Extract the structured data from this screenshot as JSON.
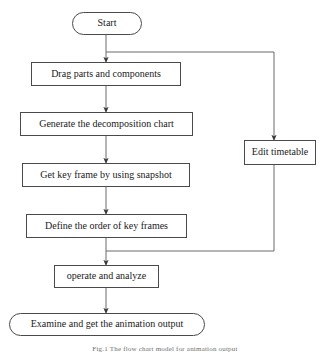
{
  "diagram": {
    "type": "flowchart",
    "orientation": "top-to-bottom",
    "stroke_color": "#4a4a4a",
    "text_color": "#1a1a1a",
    "background_color": "#ffffff",
    "nodes": [
      {
        "id": "start",
        "label": "Start",
        "shape": "terminal",
        "x": 72,
        "y": 12,
        "w": 70,
        "h": 23,
        "font_size": 10
      },
      {
        "id": "drag",
        "label": "Drag parts and components",
        "shape": "process",
        "x": 31,
        "y": 62,
        "w": 150,
        "h": 24,
        "font_size": 10
      },
      {
        "id": "generate",
        "label": "Generate the decomposition chart",
        "shape": "process",
        "x": 20,
        "y": 112,
        "w": 173,
        "h": 24,
        "font_size": 10
      },
      {
        "id": "keyframe",
        "label": "Get key frame by using snapshot",
        "shape": "process",
        "x": 22,
        "y": 163,
        "w": 168,
        "h": 24,
        "font_size": 10
      },
      {
        "id": "order",
        "label": "Define the order of key frames",
        "shape": "process",
        "x": 26,
        "y": 214,
        "w": 161,
        "h": 24,
        "font_size": 10
      },
      {
        "id": "operate",
        "label": "operate and analyze",
        "shape": "process",
        "x": 54,
        "y": 265,
        "w": 105,
        "h": 23,
        "font_size": 10
      },
      {
        "id": "examine",
        "label": "Examine and get the animation output",
        "shape": "terminal",
        "x": 9,
        "y": 313,
        "w": 196,
        "h": 23,
        "font_size": 10
      },
      {
        "id": "edit",
        "label": "Edit timetable",
        "shape": "process",
        "x": 244,
        "y": 140,
        "w": 72,
        "h": 25,
        "font_size": 10
      }
    ],
    "edges": [
      {
        "id": "start-to-drag",
        "from": "start",
        "to": "drag",
        "points": "106,35 106,60",
        "arrow": true
      },
      {
        "id": "drag-to-generate",
        "from": "drag",
        "to": "generate",
        "points": "106,86 106,110",
        "arrow": true
      },
      {
        "id": "generate-to-keyframe",
        "from": "generate",
        "to": "keyframe",
        "points": "106,136 106,161",
        "arrow": true
      },
      {
        "id": "keyframe-to-order",
        "from": "keyframe",
        "to": "order",
        "points": "106,187 106,212",
        "arrow": true
      },
      {
        "id": "order-to-operate",
        "from": "order",
        "to": "operate",
        "points": "106,238 106,263",
        "arrow": true
      },
      {
        "id": "operate-to-examine",
        "from": "operate",
        "to": "examine",
        "points": "106,288 106,311",
        "arrow": true
      },
      {
        "id": "start-branch-to-edit",
        "from": "start",
        "to": "edit",
        "points": "106,52 274,52 274,138",
        "arrow": true
      },
      {
        "id": "edit-return-to-operate",
        "from": "edit",
        "to": "operate",
        "points": "274,165 274,251 106,251",
        "arrow": false
      }
    ]
  },
  "caption": {
    "text": "Fig.1 The flow chart model for animation output"
  }
}
